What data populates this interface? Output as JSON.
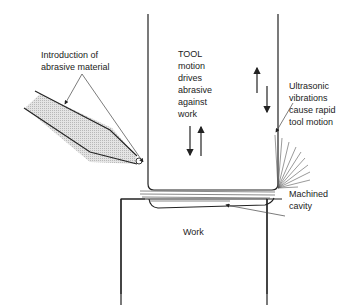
{
  "diagram": {
    "type": "ultrasonic machining schematic",
    "labels": {
      "abrasive_intro": "Introduction of\nabrasive material",
      "tool": "TOOL\nmotion\ndrives\nabrasive\nagainst\nwork",
      "ultrasonic": "Ultrasonic\nvibrations\ncause rapid\ntool motion",
      "cavity": "Machined\ncavity",
      "work": "Work"
    },
    "colors": {
      "line": "#222222",
      "nozzle_fill": "#d9d9d9",
      "background": "#ffffff"
    }
  }
}
